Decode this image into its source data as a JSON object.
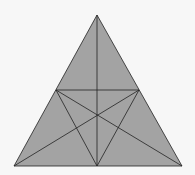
{
  "diagram": {
    "background": "#f7f7f7",
    "fill": "#a3a3a3",
    "stroke": "#222222",
    "vertices": {
      "apex": [
        97,
        15
      ],
      "bottom_left": [
        14,
        166
      ],
      "bottom_right": [
        182,
        166
      ]
    },
    "midpoints": {
      "left_side": [
        56,
        90
      ],
      "right_side": [
        139,
        90
      ],
      "bottom": [
        97,
        166
      ]
    },
    "centroid": [
      97,
      116
    ]
  }
}
